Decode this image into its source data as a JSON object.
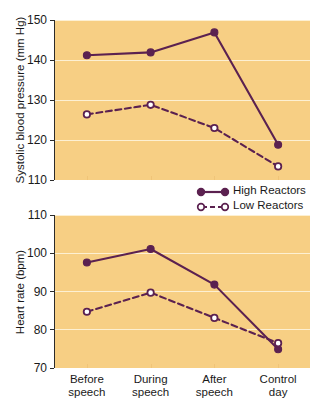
{
  "legend": {
    "position": "below-top-panel-right",
    "entries": [
      {
        "label": "High Reactors",
        "marker": "filled-circle",
        "line": "solid"
      },
      {
        "label": "Low Reactors",
        "marker": "open-circle",
        "line": "dashed"
      }
    ]
  },
  "colors": {
    "plot_background": "#f7cf84",
    "gridline": "#fdf0d2",
    "series": "#5b2150",
    "marker_open_fill": "#ffffff",
    "axis": "#2b2b2b",
    "text": "#1a1a1a"
  },
  "chart_data": [
    {
      "id": "systolic-blood-pressure",
      "type": "line",
      "title": "",
      "xlabel": "",
      "ylabel": "Systolic blood pressure (mm Hg)",
      "categories": [
        "Before speech",
        "During speech",
        "After speech",
        "Control day"
      ],
      "ylim": [
        110,
        150
      ],
      "yticks": [
        110,
        120,
        130,
        140,
        150
      ],
      "grid": true,
      "series": [
        {
          "name": "High Reactors",
          "marker": "filled-circle",
          "line": "solid",
          "values": [
            141.2,
            141.9,
            146.9,
            118.8
          ]
        },
        {
          "name": "Low Reactors",
          "marker": "open-circle",
          "line": "dashed",
          "values": [
            126.4,
            128.8,
            123.0,
            113.4
          ]
        }
      ]
    },
    {
      "id": "heart-rate",
      "type": "line",
      "title": "",
      "xlabel": "",
      "ylabel": "Heart rate (bpm)",
      "categories": [
        "Before speech",
        "During speech",
        "After speech",
        "Control day"
      ],
      "ylim": [
        70,
        110
      ],
      "yticks": [
        70,
        80,
        90,
        100,
        110
      ],
      "grid": true,
      "series": [
        {
          "name": "High Reactors",
          "marker": "filled-circle",
          "line": "solid",
          "values": [
            97.6,
            101.1,
            91.8,
            74.9
          ]
        },
        {
          "name": "Low Reactors",
          "marker": "open-circle",
          "line": "dashed",
          "values": [
            84.7,
            89.7,
            83.1,
            76.5
          ]
        }
      ]
    }
  ],
  "x_tick_labels": [
    {
      "line1": "Before",
      "line2": "speech"
    },
    {
      "line1": "During",
      "line2": "speech"
    },
    {
      "line1": "After",
      "line2": "speech"
    },
    {
      "line1": "Control",
      "line2": "day"
    }
  ]
}
